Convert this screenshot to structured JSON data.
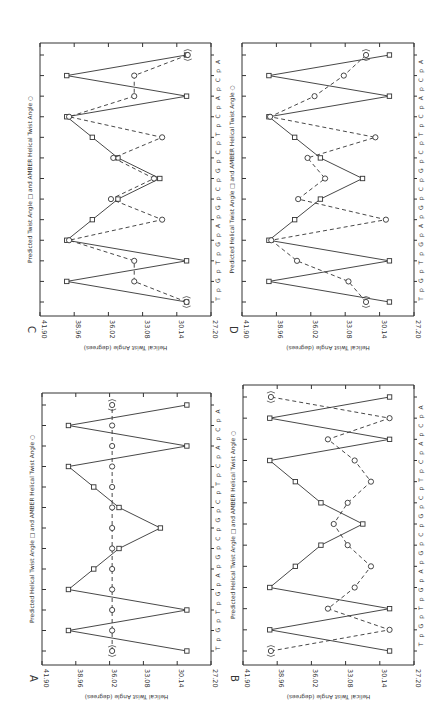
{
  "page": {
    "width": 448,
    "height": 722,
    "background": "#ffffff",
    "ink": "#333333"
  },
  "chart_data": [
    {
      "panel": "C",
      "type": "line",
      "orientation": "rotated-90-clockwise",
      "title": "Predicted Twist Angle □ and AMBER Helical Twist Angle ○",
      "xlabel": "T p G p T p G p A p G p C p G p C p T p C p A p C p A",
      "ylabel": "Helical Twist Angle (degrees)",
      "ylim": [
        27.2,
        41.9
      ],
      "yticks": [
        "41.90",
        "38.96",
        "36.02",
        "33.08",
        "30.14",
        "27.20"
      ],
      "sequence": [
        "T",
        "G",
        "T",
        "G",
        "A",
        "G",
        "C",
        "G",
        "C",
        "T",
        "C",
        "A",
        "C",
        "A"
      ],
      "categories": [
        "TpG",
        "GpT",
        "TpG",
        "GpA",
        "ApG",
        "GpC",
        "CpG",
        "GpC",
        "CpT",
        "TpC",
        "CpA",
        "ApC",
        "CpA"
      ],
      "series": [
        {
          "name": "Predicted",
          "marker": "square",
          "line": "solid",
          "values": [
            29.3,
            39.6,
            29.3,
            39.6,
            37.4,
            35.2,
            31.6,
            35.2,
            37.4,
            39.6,
            29.3,
            39.6,
            29.3
          ]
        },
        {
          "name": "AMBER",
          "marker": "circle",
          "line": "dashed",
          "values": [
            29.3,
            33.8,
            33.8,
            39.4,
            31.4,
            35.8,
            32.1,
            35.6,
            31.4,
            39.4,
            33.8,
            33.8,
            29.2
          ],
          "bracketed": [
            0,
            12
          ]
        }
      ],
      "frame": {
        "x0": 40,
        "x1": 211,
        "y0": 43,
        "y1": 316
      }
    },
    {
      "panel": "D",
      "type": "line",
      "orientation": "rotated-90-clockwise",
      "title": "Predicted Helical Twist Angle □ and AMBER Helical Twist Angle ○",
      "xlabel": "T p G p T p G p A p G p C p G p C p T p C p A p C p A",
      "ylabel": "Helical Twist Angle (degrees)",
      "ylim": [
        27.2,
        41.9
      ],
      "yticks": [
        "41.90",
        "38.96",
        "36.02",
        "33.08",
        "30.14",
        "27.20"
      ],
      "categories": [
        "TpG",
        "GpT",
        "TpG",
        "GpA",
        "ApG",
        "GpC",
        "CpG",
        "GpC",
        "CpT",
        "TpC",
        "CpA",
        "ApC",
        "CpA"
      ],
      "series": [
        {
          "name": "Predicted",
          "marker": "square",
          "line": "solid",
          "values": [
            29.3,
            39.6,
            29.3,
            39.6,
            37.4,
            35.2,
            31.6,
            35.2,
            37.4,
            39.6,
            29.3,
            39.6,
            29.3
          ]
        },
        {
          "name": "AMBER",
          "marker": "circle",
          "line": "dashed",
          "values": [
            31.3,
            32.8,
            37.2,
            39.4,
            29.6,
            37.1,
            34.8,
            36.3,
            30.5,
            39.5,
            35.7,
            33.2,
            31.3
          ],
          "bracketed": [
            0,
            12
          ]
        }
      ],
      "frame": {
        "x0": 242,
        "x1": 414,
        "y0": 43,
        "y1": 316
      }
    },
    {
      "panel": "A",
      "type": "line",
      "orientation": "rotated-90-clockwise",
      "title": "Predicted Helical Twist Angle □ and AMBER Helical Twist Angle ○",
      "xlabel": "T p G p T p G p A p G p C p G p C p T p C p A p C p A",
      "ylabel": "Helical Twist Angle (degrees)",
      "ylim": [
        27.2,
        41.9
      ],
      "yticks": [
        "41.90",
        "38.96",
        "36.02",
        "33.08",
        "30.14",
        "27.20"
      ],
      "categories": [
        "TpG",
        "GpT",
        "TpG",
        "GpA",
        "ApG",
        "GpC",
        "CpG",
        "GpC",
        "CpT",
        "TpC",
        "CpA",
        "ApC",
        "CpA"
      ],
      "series": [
        {
          "name": "Predicted",
          "marker": "square",
          "line": "solid",
          "values": [
            29.3,
            39.6,
            29.3,
            39.6,
            37.4,
            35.2,
            31.6,
            35.2,
            37.4,
            39.6,
            29.3,
            39.6,
            29.3
          ]
        },
        {
          "name": "AMBER",
          "marker": "circle",
          "line": "dashed",
          "values": [
            35.8,
            35.8,
            35.8,
            35.8,
            35.8,
            35.8,
            35.8,
            35.8,
            35.8,
            35.8,
            35.8,
            35.8,
            35.8
          ],
          "bracketed": [
            0,
            12
          ]
        }
      ],
      "frame": {
        "x0": 42,
        "x1": 211,
        "y0": 393,
        "y1": 665
      }
    },
    {
      "panel": "B",
      "type": "line",
      "orientation": "rotated-90-clockwise",
      "title": "Predicted Helical Twist Angle □ and AMBER Helical Twist Angle ○",
      "xlabel": "T p G p T p G p A p G p C p G p C p T p C p A p C p A",
      "ylabel": "Helical Twist Angle (degrees)",
      "ylim": [
        27.2,
        41.9
      ],
      "yticks": [
        "41.90",
        "38.96",
        "36.02",
        "33.08",
        "30.14",
        "27.20"
      ],
      "categories": [
        "TpG",
        "GpT",
        "TpG",
        "GpA",
        "ApG",
        "GpC",
        "CpG",
        "GpC",
        "CpT",
        "TpC",
        "CpA",
        "ApC",
        "CpA"
      ],
      "series": [
        {
          "name": "Predicted",
          "marker": "square",
          "line": "solid",
          "values": [
            29.3,
            39.6,
            29.3,
            39.6,
            37.4,
            35.2,
            31.6,
            35.2,
            37.4,
            39.6,
            29.3,
            39.6,
            29.3
          ]
        },
        {
          "name": "AMBER",
          "marker": "circle",
          "line": "dashed",
          "values": [
            39.5,
            29.3,
            34.6,
            32.3,
            30.9,
            32.9,
            34.1,
            32.9,
            30.9,
            32.3,
            34.6,
            29.3,
            39.5
          ],
          "bracketed": [
            0,
            12
          ]
        }
      ],
      "frame": {
        "x0": 243,
        "x1": 414,
        "y0": 385,
        "y1": 665
      }
    }
  ],
  "panels": {
    "C": {
      "label": "C"
    },
    "D": {
      "label": "D"
    },
    "A": {
      "label": "A"
    },
    "B": {
      "label": "B"
    }
  }
}
